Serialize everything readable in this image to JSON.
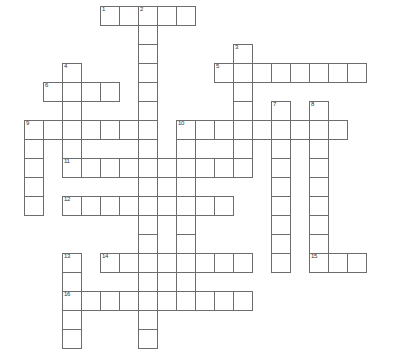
{
  "puzzle": {
    "title": "Crossword Puzzle Grid",
    "type": "blank-crossword-grid",
    "width_px": 397,
    "height_px": 362,
    "cell_size_px": 19,
    "origin_x_px": 5,
    "origin_y_px": 6,
    "columns": 20,
    "rows": 18,
    "cell_fill_color": "#ffffff",
    "cell_border_color": "#6d6d6d",
    "background_color": "#ffffff",
    "number_color": "#333333"
  },
  "numbers": [
    {
      "label": "1",
      "col": 5,
      "row": 0
    },
    {
      "label": "2",
      "col": 7,
      "row": 0
    },
    {
      "label": "3",
      "col": 12,
      "row": 2
    },
    {
      "label": "4",
      "col": 3,
      "row": 3
    },
    {
      "label": "5",
      "col": 11,
      "row": 3
    },
    {
      "label": "6",
      "col": 2,
      "row": 4
    },
    {
      "label": "7",
      "col": 14,
      "row": 5
    },
    {
      "label": "8",
      "col": 16,
      "row": 5
    },
    {
      "label": "9",
      "col": 1,
      "row": 6
    },
    {
      "label": "10",
      "col": 9,
      "row": 6
    },
    {
      "label": "11",
      "col": 3,
      "row": 8
    },
    {
      "label": "12",
      "col": 3,
      "row": 10
    },
    {
      "label": "13",
      "col": 3,
      "row": 13
    },
    {
      "label": "14",
      "col": 5,
      "row": 13
    },
    {
      "label": "15",
      "col": 16,
      "row": 13
    },
    {
      "label": "16",
      "col": 3,
      "row": 15
    }
  ],
  "entries": [
    {
      "number": "1",
      "direction": "across",
      "start_col": 5,
      "start_row": 0,
      "length": 5
    },
    {
      "number": "2",
      "direction": "down",
      "start_col": 7,
      "start_row": 0,
      "length": 9
    },
    {
      "number": "3",
      "direction": "down",
      "start_col": 12,
      "start_row": 2,
      "length": 5
    },
    {
      "number": "4",
      "direction": "down",
      "start_col": 3,
      "start_row": 3,
      "length": 6
    },
    {
      "number": "5",
      "direction": "across",
      "start_col": 11,
      "start_row": 3,
      "length": 8
    },
    {
      "number": "6",
      "direction": "across",
      "start_col": 2,
      "start_row": 4,
      "length": 4
    },
    {
      "number": "7",
      "direction": "down",
      "start_col": 14,
      "start_row": 5,
      "length": 9
    },
    {
      "number": "8",
      "direction": "down",
      "start_col": 16,
      "start_row": 5,
      "length": 9
    },
    {
      "number": "9",
      "direction": "across",
      "start_col": 1,
      "start_row": 6,
      "length": 6
    },
    {
      "number": "9",
      "direction": "down",
      "start_col": 1,
      "start_row": 6,
      "length": 6
    },
    {
      "number": "10",
      "direction": "across",
      "start_col": 9,
      "start_row": 6,
      "length": 9
    },
    {
      "number": "11",
      "direction": "across",
      "start_col": 3,
      "start_row": 8,
      "length": 10
    },
    {
      "number": "12",
      "direction": "across",
      "start_col": 3,
      "start_row": 10,
      "length": 9
    },
    {
      "number": "13",
      "direction": "down",
      "start_col": 3,
      "start_row": 13,
      "length": 5
    },
    {
      "number": "14",
      "direction": "across",
      "start_col": 5,
      "start_row": 13,
      "length": 8
    },
    {
      "number": "15",
      "direction": "across",
      "start_col": 16,
      "start_row": 13,
      "length": 3
    },
    {
      "number": "16",
      "direction": "across",
      "start_col": 3,
      "start_row": 15,
      "length": 10
    }
  ],
  "cells": [
    [
      5,
      0
    ],
    [
      6,
      0
    ],
    [
      7,
      0
    ],
    [
      8,
      0
    ],
    [
      9,
      0
    ],
    [
      7,
      1
    ],
    [
      7,
      2
    ],
    [
      12,
      2
    ],
    [
      3,
      3
    ],
    [
      7,
      3
    ],
    [
      11,
      3
    ],
    [
      12,
      3
    ],
    [
      13,
      3
    ],
    [
      14,
      3
    ],
    [
      15,
      3
    ],
    [
      16,
      3
    ],
    [
      17,
      3
    ],
    [
      18,
      3
    ],
    [
      2,
      4
    ],
    [
      3,
      4
    ],
    [
      4,
      4
    ],
    [
      5,
      4
    ],
    [
      7,
      4
    ],
    [
      12,
      4
    ],
    [
      3,
      5
    ],
    [
      7,
      5
    ],
    [
      12,
      5
    ],
    [
      14,
      5
    ],
    [
      16,
      5
    ],
    [
      1,
      6
    ],
    [
      2,
      6
    ],
    [
      3,
      6
    ],
    [
      4,
      6
    ],
    [
      5,
      6
    ],
    [
      6,
      6
    ],
    [
      7,
      6
    ],
    [
      9,
      6
    ],
    [
      10,
      6
    ],
    [
      11,
      6
    ],
    [
      12,
      6
    ],
    [
      13,
      6
    ],
    [
      14,
      6
    ],
    [
      15,
      6
    ],
    [
      16,
      6
    ],
    [
      17,
      6
    ],
    [
      1,
      7
    ],
    [
      3,
      7
    ],
    [
      7,
      7
    ],
    [
      9,
      7
    ],
    [
      12,
      7
    ],
    [
      14,
      7
    ],
    [
      16,
      7
    ],
    [
      1,
      8
    ],
    [
      3,
      8
    ],
    [
      4,
      8
    ],
    [
      5,
      8
    ],
    [
      6,
      8
    ],
    [
      7,
      8
    ],
    [
      8,
      8
    ],
    [
      9,
      8
    ],
    [
      10,
      8
    ],
    [
      11,
      8
    ],
    [
      12,
      8
    ],
    [
      14,
      8
    ],
    [
      16,
      8
    ],
    [
      1,
      9
    ],
    [
      7,
      9
    ],
    [
      9,
      9
    ],
    [
      14,
      9
    ],
    [
      16,
      9
    ],
    [
      1,
      10
    ],
    [
      3,
      10
    ],
    [
      4,
      10
    ],
    [
      5,
      10
    ],
    [
      6,
      10
    ],
    [
      7,
      10
    ],
    [
      8,
      10
    ],
    [
      9,
      10
    ],
    [
      10,
      10
    ],
    [
      11,
      10
    ],
    [
      14,
      10
    ],
    [
      16,
      10
    ],
    [
      7,
      11
    ],
    [
      9,
      11
    ],
    [
      14,
      11
    ],
    [
      16,
      11
    ],
    [
      7,
      12
    ],
    [
      9,
      12
    ],
    [
      14,
      12
    ],
    [
      16,
      12
    ],
    [
      3,
      13
    ],
    [
      5,
      13
    ],
    [
      6,
      13
    ],
    [
      7,
      13
    ],
    [
      8,
      13
    ],
    [
      9,
      13
    ],
    [
      10,
      13
    ],
    [
      11,
      13
    ],
    [
      12,
      13
    ],
    [
      14,
      13
    ],
    [
      16,
      13
    ],
    [
      17,
      13
    ],
    [
      18,
      13
    ],
    [
      3,
      14
    ],
    [
      7,
      14
    ],
    [
      9,
      14
    ],
    [
      3,
      15
    ],
    [
      4,
      15
    ],
    [
      5,
      15
    ],
    [
      6,
      15
    ],
    [
      7,
      15
    ],
    [
      8,
      15
    ],
    [
      9,
      15
    ],
    [
      10,
      15
    ],
    [
      11,
      15
    ],
    [
      12,
      15
    ],
    [
      3,
      16
    ],
    [
      7,
      16
    ],
    [
      3,
      17
    ],
    [
      7,
      17
    ]
  ]
}
